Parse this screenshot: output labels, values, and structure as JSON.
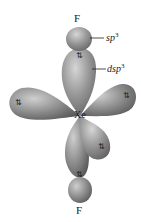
{
  "diagram": {
    "molecule": "XeF2",
    "atoms": {
      "top": "F",
      "center": "Xe",
      "bottom": "F"
    },
    "labels": {
      "sp3": {
        "base": "sp",
        "sup": "3"
      },
      "dsp3": {
        "base": "dsp",
        "sup": "3"
      }
    },
    "electron_pair_glyph": "⇅",
    "colors": {
      "lobe_light": "#c8c8c8",
      "lobe_mid": "#8f8f8f",
      "lobe_dark": "#5e5e5e",
      "text": "#1a1a1a",
      "background": "#ffffff"
    }
  }
}
